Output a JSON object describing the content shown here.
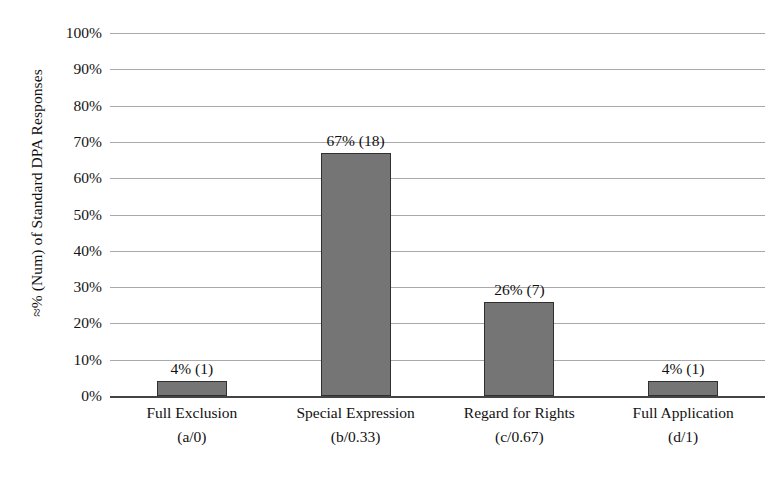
{
  "chart_data": {
    "type": "bar",
    "title": "",
    "subtitle": "",
    "xlabel": "",
    "ylabel": "≈% (Num) of Standard DPA Responses",
    "ylim": [
      0,
      100
    ],
    "grid": true,
    "legend": "none",
    "orientation": "vertical",
    "bar_color": "#757575",
    "bar_border_color": "#303030",
    "gridline_color": "#a9a9a9",
    "axis_color": "#444444",
    "background_color": "#ffffff",
    "text_color": "#111111",
    "categories": [
      "Full Exclusion",
      "Special Expression",
      "Regard for Rights",
      "Full Application"
    ],
    "category_codes": [
      "(a/0)",
      "(b/0.33)",
      "(c/0.67)",
      "(d/1)"
    ],
    "values": [
      4,
      67,
      26,
      4
    ],
    "counts": [
      1,
      18,
      7,
      1
    ],
    "data_labels": [
      "4% (1)",
      "67% (18)",
      "26% (7)",
      "4% (1)"
    ],
    "ytick_labels": [
      "100%",
      "90%",
      "80%",
      "70%",
      "60%",
      "50%",
      "40%",
      "30%",
      "20%",
      "10%",
      "0%"
    ],
    "ytick_values": [
      100,
      90,
      80,
      70,
      60,
      50,
      40,
      30,
      20,
      10,
      0
    ]
  }
}
